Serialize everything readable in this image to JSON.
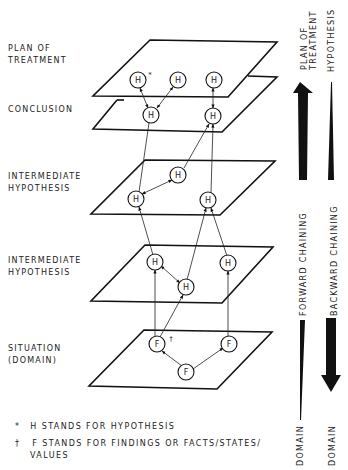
{
  "levels": [
    {
      "label_line1": "PLAN OF",
      "label_line2": "TREATMENT"
    },
    {
      "label_line1": "CONCLUSION",
      "label_line2": ""
    },
    {
      "label_line1": "INTERMEDIATE",
      "label_line2": "HYPOTHESIS"
    },
    {
      "label_line1": "INTERMEDIATE",
      "label_line2": "HYPOTHESIS"
    },
    {
      "label_line1": "SITUATION",
      "label_line2": "(DOMAIN)"
    }
  ],
  "nodes": {
    "hypothesis_symbol": "H",
    "finding_symbol": "F",
    "asterisk_mark": "*",
    "dagger_mark": "†"
  },
  "arrows": {
    "forward": {
      "label": "FORWARD CHAINING",
      "top_label_line1": "PLAN OF",
      "top_label_line2": "TREATMENT",
      "bottom_label": "DOMAIN"
    },
    "backward": {
      "label": "BACKWARD CHAINING",
      "top_label": "HYPOTHESIS",
      "bottom_label": "DOMAIN"
    }
  },
  "footnotes": [
    {
      "mark": "*",
      "text": "H  STANDS FOR HYPOTHESIS"
    },
    {
      "mark": "†",
      "text": "F  STANDS FOR FINDINGS OR FACTS/STATES/",
      "continuation": "VALUES"
    }
  ]
}
